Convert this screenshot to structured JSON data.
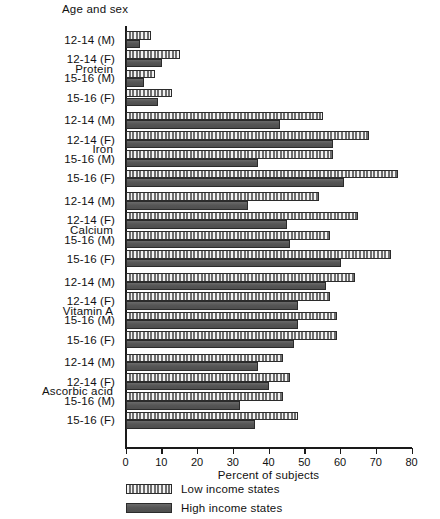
{
  "chart": {
    "top_axis_title": "Age and sex",
    "x_axis_title": "Percent of subjects",
    "x_ticks": [
      "0",
      "10",
      "20",
      "30",
      "40",
      "50",
      "60",
      "70",
      "80"
    ],
    "legend": [
      {
        "key": "low",
        "label": "Low income states"
      },
      {
        "key": "high",
        "label": "High income states"
      }
    ]
  },
  "chart_data": {
    "type": "bar",
    "orientation": "horizontal",
    "title": "",
    "xlabel": "Percent of subjects",
    "ylabel": "Age and sex",
    "xlim": [
      0,
      80
    ],
    "xticks": [
      0,
      10,
      20,
      30,
      40,
      50,
      60,
      70,
      80
    ],
    "grid": false,
    "legend_position": "bottom-left",
    "series": [
      {
        "name": "Low income states",
        "values": [
          7,
          15,
          8,
          13,
          55,
          68,
          58,
          76,
          54,
          65,
          57,
          74,
          64,
          57,
          59,
          59,
          44,
          46,
          44,
          48
        ]
      },
      {
        "name": "High income states",
        "values": [
          4,
          10,
          5,
          9,
          43,
          58,
          37,
          61,
          34,
          45,
          46,
          60,
          56,
          48,
          48,
          47,
          37,
          40,
          32,
          36
        ]
      }
    ],
    "groups": [
      {
        "nutrient": "Protein",
        "categories": [
          "12-14 (M)",
          "12-14 (F)",
          "15-16 (M)",
          "15-16 (F)"
        ],
        "low": [
          7,
          15,
          8,
          13
        ],
        "high": [
          4,
          10,
          5,
          9
        ]
      },
      {
        "nutrient": "Iron",
        "categories": [
          "12-14 (M)",
          "12-14 (F)",
          "15-16 (M)",
          "15-16 (F)"
        ],
        "low": [
          55,
          68,
          58,
          76
        ],
        "high": [
          43,
          58,
          37,
          61
        ]
      },
      {
        "nutrient": "Calcium",
        "categories": [
          "12-14 (M)",
          "12-14 (F)",
          "15-16 (M)",
          "15-16 (F)"
        ],
        "low": [
          54,
          65,
          57,
          74
        ],
        "high": [
          34,
          45,
          46,
          60
        ]
      },
      {
        "nutrient": "Vitamin A",
        "categories": [
          "12-14 (M)",
          "12-14 (F)",
          "15-16 (M)",
          "15-16 (F)"
        ],
        "low": [
          64,
          57,
          59,
          59
        ],
        "high": [
          56,
          48,
          48,
          47
        ]
      },
      {
        "nutrient": "Ascorbic acid",
        "categories": [
          "12-14 (M)",
          "12-14 (F)",
          "15-16 (M)",
          "15-16 (F)"
        ],
        "low": [
          44,
          46,
          44,
          48
        ],
        "high": [
          37,
          40,
          32,
          36
        ]
      }
    ]
  }
}
